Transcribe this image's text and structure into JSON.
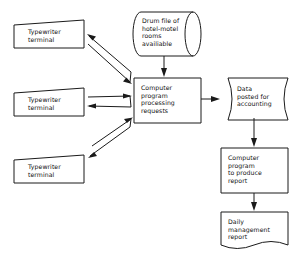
{
  "diagram": {
    "background_color": "#ffffff",
    "line_color": "#1a1a1a",
    "text_color": "#111111",
    "nodes": [
      {
        "id": "terminal_top",
        "label": "Typewriter\nterminal",
        "shape": "manual-input",
        "x": 14,
        "y": 20,
        "w": 70,
        "h": 28
      },
      {
        "id": "terminal_middle",
        "label": "Typewriter\nterminal",
        "shape": "manual-input",
        "x": 14,
        "y": 88,
        "w": 70,
        "h": 28
      },
      {
        "id": "terminal_bottom",
        "label": "Typewriter\nterminal",
        "shape": "manual-input",
        "x": 14,
        "y": 155,
        "w": 70,
        "h": 28
      },
      {
        "id": "drum_file",
        "label": "Drum file of\nhotel-motel\nrooms\navailiable",
        "shape": "drum-storage",
        "x": 133,
        "y": 12,
        "w": 68,
        "h": 44
      },
      {
        "id": "process_requests",
        "label": "Computer\nprogram\nprocessing\nrequests",
        "shape": "process",
        "x": 134,
        "y": 78,
        "w": 67,
        "h": 45
      },
      {
        "id": "data_posted",
        "label": "Data\nposted for\naccounting",
        "shape": "stored-data",
        "x": 220,
        "y": 78,
        "w": 68,
        "h": 42
      },
      {
        "id": "program_report",
        "label": "Computer\nprogram\nto produce\nreport",
        "shape": "process",
        "x": 221,
        "y": 148,
        "w": 67,
        "h": 45
      },
      {
        "id": "daily_report",
        "label": "Daily\nmanagement\nreport",
        "shape": "document",
        "x": 220,
        "y": 212,
        "w": 68,
        "h": 39
      }
    ],
    "edges": [
      {
        "id": "edge-terminal-top-to-process",
        "from": "terminal_top",
        "to": "process_requests",
        "style": "bidirectional-pair"
      },
      {
        "id": "edge-terminal-middle-to-process",
        "from": "terminal_middle",
        "to": "process_requests",
        "style": "bidirectional-pair"
      },
      {
        "id": "edge-terminal-bottom-to-process",
        "from": "terminal_bottom",
        "to": "process_requests",
        "style": "bidirectional-pair"
      },
      {
        "id": "edge-drum-to-process",
        "from": "drum_file",
        "to": "process_requests",
        "style": "arrow-down"
      },
      {
        "id": "edge-process-to-data",
        "from": "process_requests",
        "to": "data_posted",
        "style": "arrow-right"
      },
      {
        "id": "edge-data-to-program",
        "from": "data_posted",
        "to": "program_report",
        "style": "arrow-down"
      },
      {
        "id": "edge-program-to-daily",
        "from": "program_report",
        "to": "daily_report",
        "style": "arrow-down"
      }
    ]
  }
}
